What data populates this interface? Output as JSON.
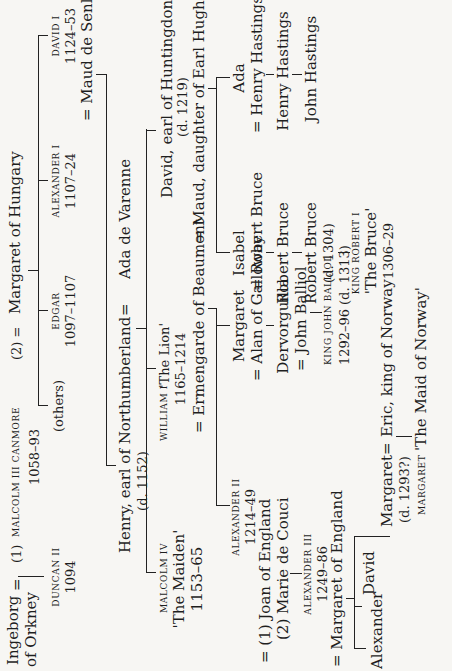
{
  "generation1": {
    "ingeborg": "Ingeborg",
    "ingeborg_of": "of Orkney",
    "eq1": "=",
    "marriage1": "(1)",
    "malcolm_name": "Malcolm III Canmore",
    "malcolm_reign": "1058–93",
    "marriage2": "(2) =",
    "margaret": "Margaret of Hungary"
  },
  "generation2": {
    "duncan_name": "Duncan II",
    "duncan_reign": "1094",
    "others": "(others)",
    "edgar_name": "Edgar",
    "edgar_reign": "1097–1107",
    "alexander1_name": "Alexander I",
    "alexander1_reign": "1107–24",
    "david1_name": "David I",
    "david1_reign": "1124–53",
    "david1_spouse": "= Maud de Senlis"
  },
  "generation3": {
    "henry": "Henry, earl of Northumberland",
    "henry_death": "(d. 1152)",
    "eq": "=",
    "ada_varenne": "Ada de Varenne"
  },
  "generation4": {
    "malcolm4_name": "Malcolm IV",
    "malcolm4_epithet": "'The Maiden'",
    "malcolm4_reign": "1153–65",
    "william_name": "William I",
    "william_epithet": "'The Lion'",
    "william_reign": "1165–1214",
    "william_spouse": "= Ermengarde of Beaumont",
    "david_hunt": "David, earl of Huntingdon",
    "david_hunt_death": "(d. 1219)",
    "david_hunt_spouse": "= Maud, daughter of Earl Hugh of Chester"
  },
  "generation5": {
    "alexander2_name": "Alexander II",
    "alexander2_reign": "1214–49",
    "alexander2_spouse1": "= (1) Joan of England",
    "alexander2_spouse2": "(2) Marie de Couci",
    "margaret_g": "Margaret",
    "margaret_g_spouse": "= Alan of Galloway",
    "isabel": "Isabel",
    "isabel_spouse": "= Robert Bruce",
    "ada": "Ada",
    "ada_spouse": "= Henry Hastings"
  },
  "generation6": {
    "alexander3_name": "Alexander III",
    "alexander3_reign": "1249–86",
    "alexander3_spouse": "= Margaret of England",
    "dervorguilla": "Dervorguilla",
    "dervorguilla_spouse": "= John Balliol",
    "robert_bruce2": "Robert Bruce",
    "henry_hastings2": "Henry Hastings"
  },
  "generation7": {
    "alexander_son": "Alexander",
    "david_son": "David",
    "margaret_d": "Margaret",
    "margaret_d_eq": "=",
    "eric": "Eric, king of Norway",
    "margaret_d_death": "(d. 1293?)",
    "john_balliol_name": "King John Balliol",
    "john_balliol_reign": "1292–96",
    "john_balliol_death": "(d. 1313)",
    "robert_bruce3": "Robert Bruce",
    "robert_bruce3_death": "(d. 1304)",
    "john_hastings": "John Hastings"
  },
  "generation8": {
    "maid_name": "Margaret",
    "maid_epithet": "'The Maid of Norway'",
    "robert1_name": "King Robert I",
    "robert1_epithet": "'The Bruce'",
    "robert1_reign": "1306–29"
  }
}
